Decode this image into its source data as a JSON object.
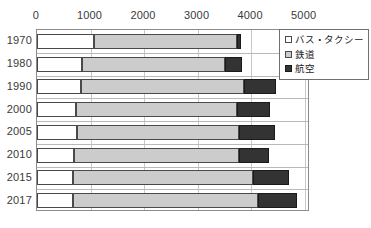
{
  "chart_data": {
    "type": "bar",
    "orientation": "horizontal",
    "stacked": true,
    "title": "",
    "xlabel": "",
    "ylabel": "",
    "xlim": [
      0,
      5100
    ],
    "xticks": [
      0,
      1000,
      2000,
      3000,
      4000,
      5000
    ],
    "xtick_labels": [
      "0",
      "1000",
      "2000",
      "3000",
      "4000",
      "5000"
    ],
    "grid": true,
    "legend_position": "top-right",
    "categories": [
      "1970",
      "1980",
      "1990",
      "2000",
      "2005",
      "2010",
      "2015",
      "2017"
    ],
    "series": [
      {
        "name": "バス・タクシー",
        "color": "#ffffff",
        "values": [
          1065,
          840,
          820,
          730,
          750,
          690,
          670,
          670
        ]
      },
      {
        "name": "鉄道",
        "color": "#cccccc",
        "values": [
          2670,
          2670,
          3050,
          3010,
          3030,
          3085,
          3365,
          3460
        ]
      },
      {
        "name": "航空",
        "color": "#333333",
        "values": [
          75,
          320,
          600,
          615,
          675,
          560,
          670,
          730
        ]
      }
    ],
    "totals": [
      3810,
      3830,
      4470,
      4355,
      4455,
      4335,
      4705,
      4860
    ]
  },
  "legend": {
    "items": [
      {
        "label": "バス・タクシー",
        "swatch": "bus"
      },
      {
        "label": "鉄道",
        "swatch": "rail"
      },
      {
        "label": "航空",
        "swatch": "air"
      }
    ]
  },
  "colors": {
    "bus": "#ffffff",
    "rail": "#cccccc",
    "air": "#333333",
    "border": "#4a4a4a",
    "grid": "#c9c9c9",
    "frame": "#8b8b8b",
    "text": "#3a3a3a"
  }
}
